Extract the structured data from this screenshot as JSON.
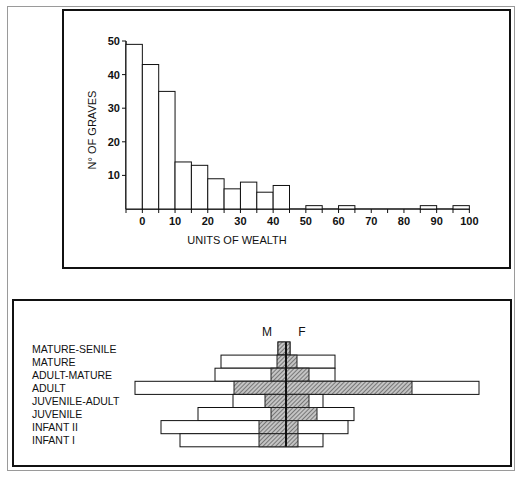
{
  "chart_data": [
    {
      "type": "bar",
      "title": "",
      "xlabel": "UNITS OF WEALTH",
      "ylabel": "N° OF GRAVES",
      "ylim": [
        0,
        50
      ],
      "xlim": [
        -5,
        100
      ],
      "y_ticks": [
        10,
        20,
        30,
        40,
        50
      ],
      "x_ticks": [
        0,
        10,
        20,
        30,
        40,
        50,
        60,
        70,
        80,
        90,
        100
      ],
      "bin_width": 5,
      "bins": [
        {
          "from": -5,
          "to": 0,
          "value": 49
        },
        {
          "from": 0,
          "to": 5,
          "value": 43
        },
        {
          "from": 5,
          "to": 10,
          "value": 35
        },
        {
          "from": 10,
          "to": 15,
          "value": 14
        },
        {
          "from": 15,
          "to": 20,
          "value": 13
        },
        {
          "from": 20,
          "to": 25,
          "value": 9
        },
        {
          "from": 25,
          "to": 30,
          "value": 6
        },
        {
          "from": 30,
          "to": 35,
          "value": 8
        },
        {
          "from": 35,
          "to": 40,
          "value": 5
        },
        {
          "from": 40,
          "to": 45,
          "value": 7
        },
        {
          "from": 50,
          "to": 55,
          "value": 1
        },
        {
          "from": 60,
          "to": 65,
          "value": 1
        },
        {
          "from": 85,
          "to": 90,
          "value": 1
        },
        {
          "from": 95,
          "to": 100,
          "value": 1
        }
      ],
      "grid": false,
      "legend": null
    },
    {
      "type": "bar",
      "subtype": "population-pyramid",
      "title": "",
      "side_labels": {
        "left": "M",
        "right": "F"
      },
      "note": "Values are relative extents (px) from central axis; no scale shown. Outer bar = total, hatched = sexed portion.",
      "categories": [
        "MATURE-SENILE",
        "MATURE",
        "ADULT-MATURE",
        "ADULT",
        "JUVENILE-ADULT",
        "JUVENILE",
        "INFANT  II",
        "INFANT  I"
      ],
      "series": [
        {
          "name": "outer-left (M)",
          "values": [
            8,
            65,
            71,
            151,
            53,
            88,
            125,
            106
          ]
        },
        {
          "name": "outer-right (F)",
          "values": [
            4,
            49,
            49,
            193,
            37,
            68,
            62,
            37
          ]
        },
        {
          "name": "hatched-left (M)",
          "values": [
            8,
            9,
            15,
            52,
            21,
            15,
            27,
            27
          ]
        },
        {
          "name": "hatched-right (F)",
          "values": [
            4,
            11,
            23,
            126,
            23,
            31,
            12,
            12
          ]
        }
      ]
    }
  ],
  "histogram": {
    "ylabel": "N° OF GRAVES",
    "xlabel": "UNITS OF WEALTH",
    "y_ticks": [
      "10",
      "20",
      "30",
      "40",
      "50"
    ],
    "x_ticks": [
      "0",
      "10",
      "20",
      "30",
      "40",
      "50",
      "60",
      "70",
      "80",
      "90",
      "100"
    ]
  },
  "pyramid": {
    "label_m": "M",
    "label_f": "F",
    "rows": [
      "MATURE-SENILE",
      "MATURE",
      "ADULT-MATURE",
      "ADULT",
      "JUVENILE-ADULT",
      "JUVENILE",
      "INFANT  II",
      "INFANT  I"
    ]
  },
  "colors": {
    "ink": "#111111",
    "hatch": "#8a8a8a",
    "frame": "#9a9a9a"
  }
}
